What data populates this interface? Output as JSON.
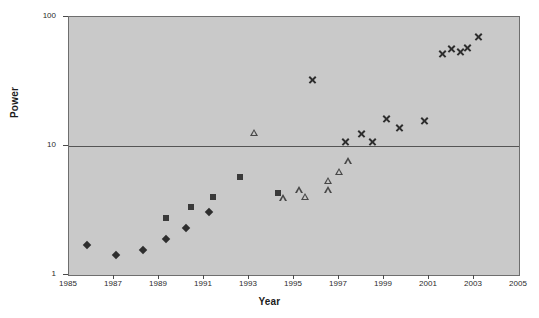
{
  "chart_data": {
    "type": "scatter",
    "title": "",
    "xlabel": "Year",
    "ylabel": "Power",
    "xlim": [
      1985,
      2005
    ],
    "ylim": [
      1,
      100
    ],
    "yscale": "log",
    "xticks": [
      1985,
      1987,
      1989,
      1991,
      1993,
      1995,
      1997,
      1999,
      2001,
      2003,
      2005
    ],
    "xtick_labels": [
      "1985",
      "1987",
      "1989",
      "1991",
      "1993",
      "1995",
      "1997",
      "1999",
      "2001",
      "2003",
      "2005"
    ],
    "yticks": [
      1,
      10,
      100
    ],
    "ytick_labels": [
      "1",
      "10",
      "100"
    ],
    "grid": "horizontal-major-only",
    "legend": "none",
    "plot_background": "#c9c9c9",
    "figure_background": "#ffffff",
    "marker_color": "#2e2e2e",
    "series": [
      {
        "name": "series-diamond",
        "marker": "diamond",
        "points": [
          {
            "x": 1985.8,
            "y": 1.72
          },
          {
            "x": 1987.1,
            "y": 1.43
          },
          {
            "x": 1988.3,
            "y": 1.56
          },
          {
            "x": 1989.3,
            "y": 1.9
          },
          {
            "x": 1990.2,
            "y": 2.3
          },
          {
            "x": 1991.2,
            "y": 3.1
          }
        ]
      },
      {
        "name": "series-square",
        "marker": "square",
        "points": [
          {
            "x": 1989.3,
            "y": 2.75
          },
          {
            "x": 1990.4,
            "y": 3.35
          },
          {
            "x": 1991.4,
            "y": 4.05
          },
          {
            "x": 1992.6,
            "y": 5.7
          },
          {
            "x": 1994.3,
            "y": 4.3
          }
        ]
      },
      {
        "name": "series-triangle",
        "marker": "triangle",
        "points": [
          {
            "x": 1993.2,
            "y": 12.7
          },
          {
            "x": 1994.5,
            "y": 3.95
          },
          {
            "x": 1995.2,
            "y": 4.55
          },
          {
            "x": 1995.5,
            "y": 4.05
          },
          {
            "x": 1996.5,
            "y": 5.4
          },
          {
            "x": 1996.5,
            "y": 4.55
          },
          {
            "x": 1997.0,
            "y": 6.3
          },
          {
            "x": 1997.4,
            "y": 7.6
          }
        ]
      },
      {
        "name": "series-cross",
        "marker": "cross",
        "points": [
          {
            "x": 1995.8,
            "y": 32.5
          },
          {
            "x": 1997.3,
            "y": 10.8
          },
          {
            "x": 1998.0,
            "y": 12.6
          },
          {
            "x": 1998.5,
            "y": 10.8
          },
          {
            "x": 1999.1,
            "y": 16.4
          },
          {
            "x": 1999.7,
            "y": 14.0
          },
          {
            "x": 2000.8,
            "y": 15.9
          },
          {
            "x": 2001.6,
            "y": 52.0
          },
          {
            "x": 2002.0,
            "y": 57.0
          },
          {
            "x": 2002.4,
            "y": 54.0
          },
          {
            "x": 2002.7,
            "y": 58.0
          },
          {
            "x": 2003.2,
            "y": 70.0
          }
        ]
      }
    ]
  }
}
